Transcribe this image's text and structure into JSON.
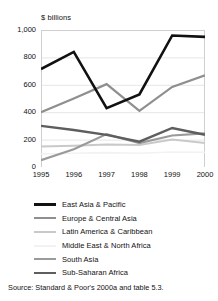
{
  "chart_data": {
    "type": "line",
    "title": "",
    "ylabel": "$ billions",
    "xlabel": "",
    "categories": [
      "1995",
      "1996",
      "1997",
      "1998",
      "1999",
      "2000"
    ],
    "x": [
      1995,
      1996,
      1997,
      1998,
      1999,
      2000
    ],
    "ylim": [
      0,
      1000
    ],
    "yticks": [
      "0",
      "200",
      "400",
      "600",
      "800",
      "1,000"
    ],
    "ytick_values": [
      0,
      200,
      400,
      600,
      800,
      1000
    ],
    "grid": true,
    "legend_position": "below",
    "series": [
      {
        "name": "East Asia & Pacific",
        "color": "#111111",
        "width": 2.6,
        "values": [
          715,
          840,
          430,
          530,
          960,
          950
        ]
      },
      {
        "name": "Europe & Central Asia",
        "color": "#8f8f8f",
        "width": 2.2,
        "values": [
          400,
          500,
          605,
          410,
          585,
          670
        ]
      },
      {
        "name": "Latin America & Caribbean",
        "color": "#c9c9c9",
        "width": 2.0,
        "values": [
          150,
          155,
          165,
          160,
          200,
          175
        ]
      },
      {
        "name": "Middle East & North Africa",
        "color": "#f2f2f2",
        "width": 1.6,
        "values": [
          95,
          100,
          105,
          100,
          110,
          108
        ]
      },
      {
        "name": "South Asia",
        "color": "#9a9a9a",
        "width": 2.2,
        "values": [
          50,
          130,
          240,
          175,
          230,
          245
        ]
      },
      {
        "name": "Sub-Saharan Africa",
        "color": "#5e5e5e",
        "width": 2.4,
        "values": [
          300,
          270,
          235,
          185,
          285,
          235
        ]
      }
    ]
  },
  "source": {
    "text": "Source:  Standard & Poor's 2000a and table 5.3."
  }
}
